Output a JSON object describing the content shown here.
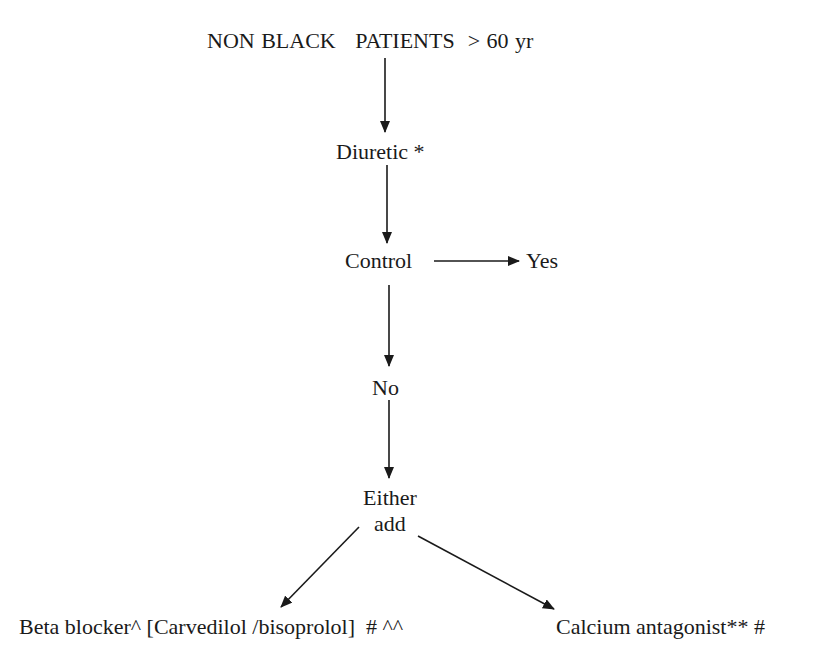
{
  "diagram": {
    "type": "flowchart",
    "nodes": {
      "start": "NON BLACK   PATIENTS  > 60 yr",
      "diuretic": "Diuretic *",
      "control": "Control",
      "yes": "Yes",
      "no": "No",
      "either_line1": "Either",
      "either_line2": "add",
      "beta_blocker": "Beta blocker^ [Carvedilol /bisoprolol]  # ^^",
      "calcium": "Calcium antagonist** #"
    },
    "edges": [
      {
        "from": "start",
        "to": "diuretic"
      },
      {
        "from": "diuretic",
        "to": "control"
      },
      {
        "from": "control",
        "to": "yes"
      },
      {
        "from": "control",
        "to": "no"
      },
      {
        "from": "no",
        "to": "either"
      },
      {
        "from": "either",
        "to": "beta_blocker"
      },
      {
        "from": "either",
        "to": "calcium"
      }
    ],
    "line_color": "#1a1a1a"
  }
}
